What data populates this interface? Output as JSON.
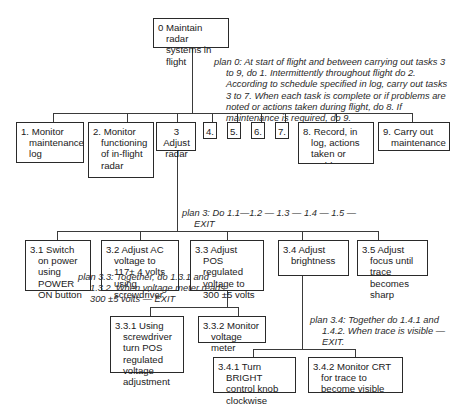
{
  "diagram": {
    "type": "hierarchical-task-analysis",
    "root": {
      "id": "0",
      "label": "0 Maintain radar systems in flight"
    },
    "plans": {
      "plan0": "plan 0:  At start of flight and between carrying out tasks 3 to 9, do 1.  Intermittently throughout flight do 2.  According to schedule specified in log, carry out tasks 3 to 7.  When each task is complete or if problems are noted or actions taken during flight, do 8.  If maintenance is required, do 9.",
      "plan3": "plan 3: Do 1.1—1.2 — 1.3 — 1.4 — 1.5 — EXIT",
      "plan3_3": "plan 3.3: Together, do 1.3.1 and 1.3.2.  When voltage meter reads 300  ±5          volts — EXIT",
      "plan3_4": "plan 3.4: Together do 1.4.1 and 1.4.2.  When trace is visible — EXIT."
    },
    "level1": [
      {
        "id": "1",
        "label": "1. Monitor maintenance log"
      },
      {
        "id": "2",
        "label": "2. Monitor functioning of in-flight radar"
      },
      {
        "id": "3",
        "label": "3 Adjust radar"
      },
      {
        "id": "4",
        "label": "4."
      },
      {
        "id": "5",
        "label": "5."
      },
      {
        "id": "6",
        "label": "6."
      },
      {
        "id": "7",
        "label": "7."
      },
      {
        "id": "8",
        "label": "8. Record, in log, actions taken or problems"
      },
      {
        "id": "9",
        "label": "9. Carry out maintenance"
      }
    ],
    "level2": [
      {
        "id": "3.1",
        "label": "3.1 Switch on power using POWER ON button"
      },
      {
        "id": "3.2",
        "label": "3.2 Adjust AC voltage to 117± 4 volts using screwdriver"
      },
      {
        "id": "3.3",
        "label": "3.3 Adjust POS regulated voltage to 300 ±5 volts"
      },
      {
        "id": "3.4",
        "label": "3.4 Adjust brightness"
      },
      {
        "id": "3.5",
        "label": "3.5 Adjust focus until trace becomes sharp"
      }
    ],
    "level3": [
      {
        "id": "3.3.1",
        "label": "3.3.1 Using screwdriver turn POS regulated voltage adjustment"
      },
      {
        "id": "3.3.2",
        "label": "3.3.2 Monitor voltage meter"
      },
      {
        "id": "3.4.1",
        "label": "3.4.1 Turn BRIGHT control knob clockwise"
      },
      {
        "id": "3.4.2",
        "label": "3.4.2 Monitor CRT for trace to become visible"
      }
    ]
  }
}
